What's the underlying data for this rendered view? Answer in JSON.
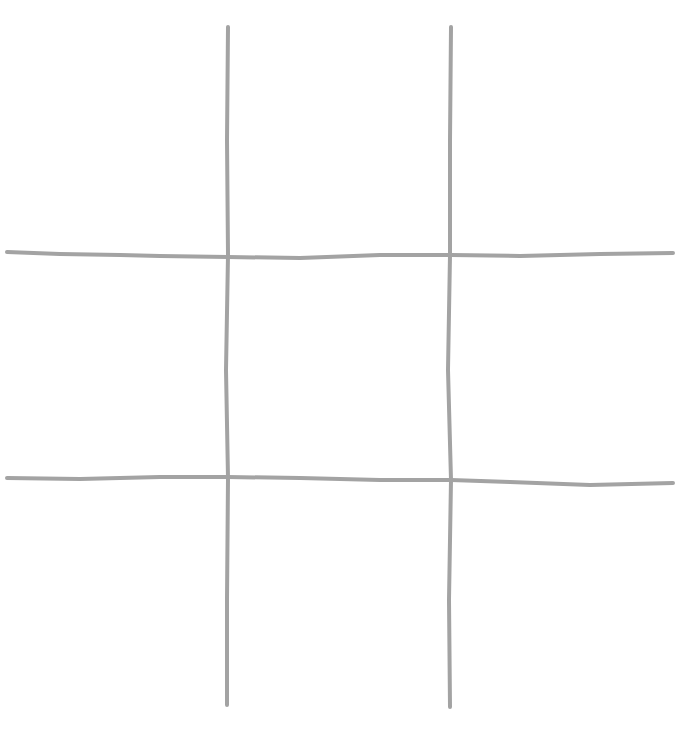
{
  "drawing": {
    "subject": "hand-drawn tic-tac-toe grid",
    "background_color": "#ffffff",
    "line_color": "#a3a3a3",
    "line_width": 4,
    "lines": {
      "vertical": [
        {
          "points": [
            [
              228,
              27
            ],
            [
              227,
              140
            ],
            [
              228,
              255
            ],
            [
              226,
              370
            ],
            [
              228,
              478
            ],
            [
              227,
              600
            ],
            [
              227,
              705
            ]
          ]
        },
        {
          "points": [
            [
              451,
              27
            ],
            [
              450,
              140
            ],
            [
              450,
              255
            ],
            [
              448,
              370
            ],
            [
              451,
              480
            ],
            [
              449,
              600
            ],
            [
              450,
              707
            ]
          ]
        }
      ],
      "horizontal": [
        {
          "points": [
            [
              7,
              252
            ],
            [
              60,
              254
            ],
            [
              120,
              255
            ],
            [
              160,
              256
            ],
            [
              228,
              257
            ],
            [
              300,
              258
            ],
            [
              380,
              255
            ],
            [
              451,
              255
            ],
            [
              520,
              256
            ],
            [
              600,
              254
            ],
            [
              673,
              253
            ]
          ]
        },
        {
          "points": [
            [
              7,
              478
            ],
            [
              80,
              479
            ],
            [
              160,
              477
            ],
            [
              228,
              477
            ],
            [
              300,
              478
            ],
            [
              380,
              480
            ],
            [
              451,
              480
            ],
            [
              510,
              482
            ],
            [
              590,
              485
            ],
            [
              673,
              483
            ]
          ]
        }
      ]
    },
    "cells": [
      {
        "row": 0,
        "col": 0,
        "x": 8,
        "y": 28,
        "w": 218,
        "h": 222,
        "mark": ""
      },
      {
        "row": 0,
        "col": 1,
        "x": 230,
        "y": 28,
        "w": 218,
        "h": 222,
        "mark": ""
      },
      {
        "row": 0,
        "col": 2,
        "x": 453,
        "y": 28,
        "w": 220,
        "h": 222,
        "mark": ""
      },
      {
        "row": 1,
        "col": 0,
        "x": 8,
        "y": 259,
        "w": 218,
        "h": 216,
        "mark": ""
      },
      {
        "row": 1,
        "col": 1,
        "x": 230,
        "y": 259,
        "w": 218,
        "h": 216,
        "mark": ""
      },
      {
        "row": 1,
        "col": 2,
        "x": 453,
        "y": 259,
        "w": 220,
        "h": 216,
        "mark": ""
      },
      {
        "row": 2,
        "col": 0,
        "x": 8,
        "y": 482,
        "w": 218,
        "h": 222,
        "mark": ""
      },
      {
        "row": 2,
        "col": 1,
        "x": 230,
        "y": 482,
        "w": 218,
        "h": 222,
        "mark": ""
      },
      {
        "row": 2,
        "col": 2,
        "x": 453,
        "y": 482,
        "w": 220,
        "h": 222,
        "mark": ""
      }
    ]
  }
}
